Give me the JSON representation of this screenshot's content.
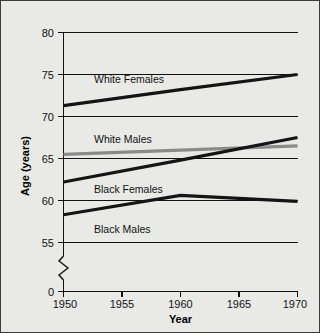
{
  "chart_data": {
    "type": "line",
    "title": "",
    "xlabel": "Year",
    "ylabel": "Age (years)",
    "x": [
      1950,
      1955,
      1960,
      1965,
      1970
    ],
    "xlim": [
      1950,
      1970
    ],
    "ylim": [
      55,
      80
    ],
    "xticks": [
      "1950",
      "1955",
      "1960",
      "1965",
      "1970"
    ],
    "yticks": [
      "80",
      "75",
      "70",
      "65",
      "60",
      "55",
      "0"
    ],
    "grid": true,
    "axis_break": true,
    "axis_break_label": "0",
    "legend_position": "inline-annotations",
    "series": [
      {
        "name": "White Females",
        "color": "#141414",
        "x": [
          1950,
          1960,
          1970
        ],
        "values": [
          71.3,
          73.2,
          75.0
        ],
        "label": "White Females"
      },
      {
        "name": "White Males",
        "color": "#8a8a8a",
        "x": [
          1950,
          1960,
          1970
        ],
        "values": [
          65.5,
          66.0,
          66.5
        ],
        "label": "White Males"
      },
      {
        "name": "Black Females",
        "color": "#141414",
        "x": [
          1950,
          1960,
          1970
        ],
        "values": [
          62.2,
          64.8,
          67.5
        ],
        "label": "Black Females"
      },
      {
        "name": "Black Males",
        "color": "#141414",
        "x": [
          1950,
          1960,
          1970
        ],
        "values": [
          58.3,
          60.6,
          59.9
        ],
        "label": "Black Males"
      }
    ]
  },
  "axis": {
    "y_title": "Age (years)",
    "x_title": "Year",
    "y_tick_80": "80",
    "y_tick_75": "75",
    "y_tick_70": "70",
    "y_tick_65": "65",
    "y_tick_60": "60",
    "y_tick_55": "55",
    "y_tick_0": "0",
    "x_tick_1950": "1950",
    "x_tick_1955": "1955",
    "x_tick_1960": "1960",
    "x_tick_1965": "1965",
    "x_tick_1970": "1970"
  },
  "annotations": {
    "white_females": "White Females",
    "white_males": "White Males",
    "black_females": "Black Females",
    "black_males": "Black Males"
  },
  "colors": {
    "background": "#e9e9e6",
    "border": "#3b3b3b",
    "line_dark": "#141414",
    "line_gray": "#8a8a8a",
    "text": "#111111"
  }
}
